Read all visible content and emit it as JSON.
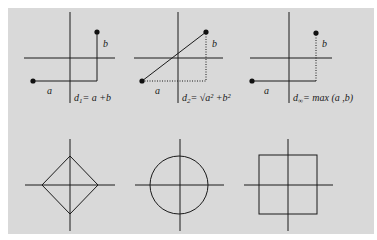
{
  "figure": {
    "background": "#d9d9d9",
    "line_color": "#1a1a1a",
    "panels_top": [
      {
        "name": "manhattan",
        "label_a": "a",
        "label_b": "b",
        "formula_main": "d",
        "formula_sub": "1",
        "formula_rest": "= a +b"
      },
      {
        "name": "euclidean",
        "label_a": "a",
        "label_b": "b",
        "formula_main": "d",
        "formula_sub": "2",
        "formula_rest": "= √a² +b²"
      },
      {
        "name": "chebyshev",
        "label_a": "a",
        "label_b": "b",
        "formula_main": "d",
        "formula_sub": "∞",
        "formula_rest": "= max (a ,b)"
      }
    ],
    "panels_bottom": [
      {
        "name": "diamond",
        "shape": "diamond"
      },
      {
        "name": "circle",
        "shape": "circle"
      },
      {
        "name": "square",
        "shape": "square"
      }
    ]
  }
}
